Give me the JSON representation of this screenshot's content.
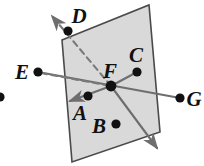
{
  "figure": {
    "type": "geometry-diagram",
    "width": 204,
    "height": 166,
    "background_color": "#ffffff",
    "plane": {
      "name": "shaded-plane",
      "fill_color": "#d9d9d9",
      "stroke_color": "#4a4a4a",
      "corners": [
        {
          "x": 62,
          "y": 40
        },
        {
          "x": 149,
          "y": 5
        },
        {
          "x": 160,
          "y": 132
        },
        {
          "x": 72,
          "y": 162
        }
      ]
    },
    "line_color": "#6e6e6e",
    "dash_color": "#7a7a7a",
    "dot_color": "#111111",
    "points": [
      {
        "id": "A",
        "label": "A",
        "dot": {
          "x": 88,
          "y": 96
        },
        "label_pos": {
          "x": 80,
          "y": 120
        }
      },
      {
        "id": "B",
        "label": "B",
        "dot": {
          "x": 116,
          "y": 124
        },
        "label_pos": {
          "x": 96,
          "y": 134
        }
      },
      {
        "id": "C",
        "label": "C",
        "dot": {
          "x": 137,
          "y": 72
        },
        "label_pos": {
          "x": 133,
          "y": 62
        }
      },
      {
        "id": "D",
        "label": "D",
        "dot": {
          "x": 68,
          "y": 31
        },
        "label_pos": {
          "x": 74,
          "y": 22
        }
      },
      {
        "id": "E",
        "label": "E",
        "dot": {
          "x": 38,
          "y": 72
        },
        "label_pos": {
          "x": 18,
          "y": 78
        }
      },
      {
        "id": "F",
        "label": "F",
        "dot": {
          "x": 111,
          "y": 86
        },
        "label_pos": {
          "x": 107,
          "y": 77
        }
      },
      {
        "id": "G",
        "label": "G",
        "dot": {
          "x": 180,
          "y": 98
        },
        "label_pos": {
          "x": 188,
          "y": 106
        }
      }
    ],
    "edge_point": {
      "name": "edge-dot",
      "x": 0,
      "y": 97
    },
    "lines": [
      {
        "name": "line-D-through-F",
        "style": "dashed",
        "from": {
          "x": 48,
          "y": 10
        },
        "to": {
          "x": 111,
          "y": 86
        },
        "arrow": "start"
      },
      {
        "name": "line-E-to-F",
        "style": "dashed",
        "from": {
          "x": 38,
          "y": 72
        },
        "to": {
          "x": 111,
          "y": 86
        },
        "arrow": "none"
      },
      {
        "name": "line-E-to-G",
        "style": "solid",
        "from": {
          "x": 38,
          "y": 72
        },
        "to": {
          "x": 180,
          "y": 98
        },
        "arrow": "none"
      },
      {
        "name": "line-F-to-lower-left",
        "style": "solid",
        "from": {
          "x": 111,
          "y": 86
        },
        "to": {
          "x": 66,
          "y": 103
        },
        "arrow": "end"
      },
      {
        "name": "line-F-to-lower-right",
        "style": "solid",
        "from": {
          "x": 111,
          "y": 86
        },
        "to": {
          "x": 160,
          "y": 152
        },
        "arrow": "end"
      },
      {
        "name": "line-F-to-C",
        "style": "solid",
        "from": {
          "x": 111,
          "y": 86
        },
        "to": {
          "x": 137,
          "y": 72
        },
        "arrow": "none"
      }
    ]
  }
}
